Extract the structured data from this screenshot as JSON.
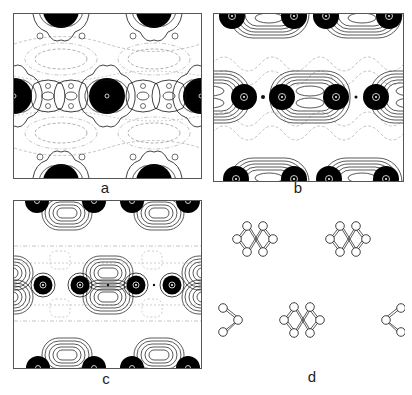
{
  "figure": {
    "panels": [
      {
        "id": "a",
        "label": "a",
        "type": "contour-map",
        "description": "Charge density contour map, dark filled maxima at atom sites with solid and dashed contour lines"
      },
      {
        "id": "b",
        "label": "b",
        "type": "contour-map",
        "description": "Contour map with pill-shaped nested contours between atom pairs"
      },
      {
        "id": "c",
        "label": "c",
        "type": "contour-map",
        "description": "Contour map with double-lobed nested contours between atom pairs"
      },
      {
        "id": "d",
        "label": "d",
        "type": "structure-diagram",
        "description": "Ball-and-stick structure of atom clusters in crossed rhombus arrangement"
      }
    ]
  },
  "colors": {
    "ink": "#111111",
    "dashed": "#777777",
    "frame": "#555555",
    "background": "#ffffff"
  }
}
